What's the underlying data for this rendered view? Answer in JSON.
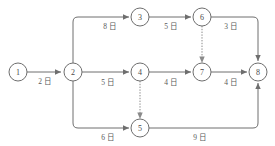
{
  "diagram": {
    "type": "activity-on-arrow-network",
    "unit_suffix": "日",
    "nodes": [
      {
        "id": "1",
        "label": "1",
        "x": 18,
        "y": 72,
        "r": 9
      },
      {
        "id": "2",
        "label": "2",
        "x": 73,
        "y": 72,
        "r": 9
      },
      {
        "id": "3",
        "label": "3",
        "x": 140,
        "y": 17,
        "r": 9
      },
      {
        "id": "4",
        "label": "4",
        "x": 140,
        "y": 72,
        "r": 9
      },
      {
        "id": "5",
        "label": "5",
        "x": 140,
        "y": 128,
        "r": 9
      },
      {
        "id": "6",
        "label": "6",
        "x": 202,
        "y": 17,
        "r": 9
      },
      {
        "id": "7",
        "label": "7",
        "x": 202,
        "y": 72,
        "r": 9
      },
      {
        "id": "8",
        "label": "8",
        "x": 258,
        "y": 72,
        "r": 9
      }
    ],
    "edges": [
      {
        "from": "1",
        "to": "2",
        "duration": 2,
        "label": "2 日",
        "style": "solid",
        "label_x": 45,
        "label_y": 81
      },
      {
        "from": "2",
        "to": "3",
        "duration": 8,
        "label": "8 日",
        "style": "solid",
        "label_x": 110,
        "label_y": 26
      },
      {
        "from": "2",
        "to": "4",
        "duration": 5,
        "label": "5 日",
        "style": "solid",
        "label_x": 108,
        "label_y": 82
      },
      {
        "from": "2",
        "to": "5",
        "duration": 6,
        "label": "6 日",
        "style": "solid",
        "label_x": 108,
        "label_y": 137
      },
      {
        "from": "3",
        "to": "6",
        "duration": 5,
        "label": "5 日",
        "style": "solid",
        "label_x": 171,
        "label_y": 26
      },
      {
        "from": "6",
        "to": "8",
        "duration": 3,
        "label": "3 日",
        "style": "solid",
        "label_x": 231,
        "label_y": 26
      },
      {
        "from": "4",
        "to": "7",
        "duration": 4,
        "label": "4 日",
        "style": "solid",
        "label_x": 171,
        "label_y": 82
      },
      {
        "from": "7",
        "to": "8",
        "duration": 4,
        "label": "4 日",
        "style": "solid",
        "label_x": 231,
        "label_y": 82
      },
      {
        "from": "5",
        "to": "8",
        "duration": 9,
        "label": "9 日",
        "style": "solid",
        "label_x": 200,
        "label_y": 137
      },
      {
        "from": "6",
        "to": "7",
        "duration": 0,
        "label": "",
        "style": "dashed",
        "label_x": 0,
        "label_y": 0
      },
      {
        "from": "4",
        "to": "5",
        "duration": 0,
        "label": "",
        "style": "dashed",
        "label_x": 0,
        "label_y": 0
      }
    ],
    "colors": {
      "line": "#6e6e6e",
      "dashed_line": "#8a8a8a",
      "node_fill": "#ffffff",
      "text": "#4a4a4a",
      "label_text": "#5a5a5a",
      "background": "#ffffff"
    }
  }
}
